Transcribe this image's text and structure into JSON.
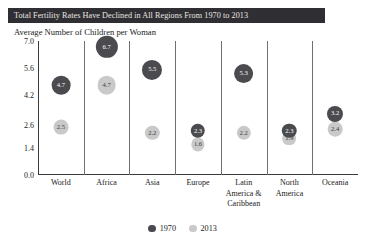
{
  "chart_data": {
    "type": "scatter",
    "title": "Total Fertility Rates Have Declined in All Regions From 1970 to 2013",
    "subtitle": "Average Number of Children per Woman",
    "xlabel": "",
    "ylabel": "Average Number of Children per Woman",
    "ylim": [
      0.0,
      7.0
    ],
    "yticks": [
      "0.0",
      "1.4",
      "2.6",
      "4.2",
      "5.6",
      "7.0"
    ],
    "ytick_values": [
      0.0,
      1.4,
      2.6,
      4.2,
      5.6,
      7.0
    ],
    "grid": false,
    "legend_position": "bottom-center",
    "categories": [
      "World",
      "Africa",
      "Asia",
      "Europe",
      "Latin America & Caribbean",
      "North America",
      "Oceania"
    ],
    "series": [
      {
        "name": "1970",
        "color": "#4a4a4f",
        "values": [
          4.7,
          6.7,
          5.5,
          2.3,
          5.3,
          2.3,
          3.2
        ],
        "labels": [
          "4.7",
          "6.7",
          "5.5",
          "2.3",
          "5.3",
          "2.3",
          "3.2"
        ]
      },
      {
        "name": "2013",
        "color": "#c9c9c9",
        "values": [
          2.5,
          4.7,
          2.2,
          1.6,
          2.2,
          1.9,
          2.4
        ],
        "labels": [
          "2.5",
          "4.7",
          "2.2",
          "1.6",
          "2.2",
          "1.9",
          "2.4"
        ]
      }
    ]
  },
  "title_banner": {
    "text": "Total Fertility Rates Have Declined in All Regions From 1970 to 2013",
    "background": "#2f2f33",
    "color": "#e9e6e1"
  },
  "subtitle": {
    "text": "Average Number of Children per Woman"
  },
  "yaxis": {
    "ticks": [
      "7.0",
      "5.6",
      "4.2",
      "2.6",
      "1.4",
      "0.0"
    ]
  },
  "xaxis": {
    "categories": [
      {
        "lines": [
          "World"
        ]
      },
      {
        "lines": [
          "Africa"
        ]
      },
      {
        "lines": [
          "Asia"
        ]
      },
      {
        "lines": [
          "Europe"
        ]
      },
      {
        "lines": [
          "Latin",
          "America &",
          "Caribbean"
        ]
      },
      {
        "lines": [
          "North",
          "America"
        ]
      },
      {
        "lines": [
          "Oceania"
        ]
      }
    ]
  },
  "legend": {
    "items": [
      {
        "label": "1970",
        "color": "#4a4a4f"
      },
      {
        "label": "2013",
        "color": "#c9c9c9"
      }
    ]
  }
}
